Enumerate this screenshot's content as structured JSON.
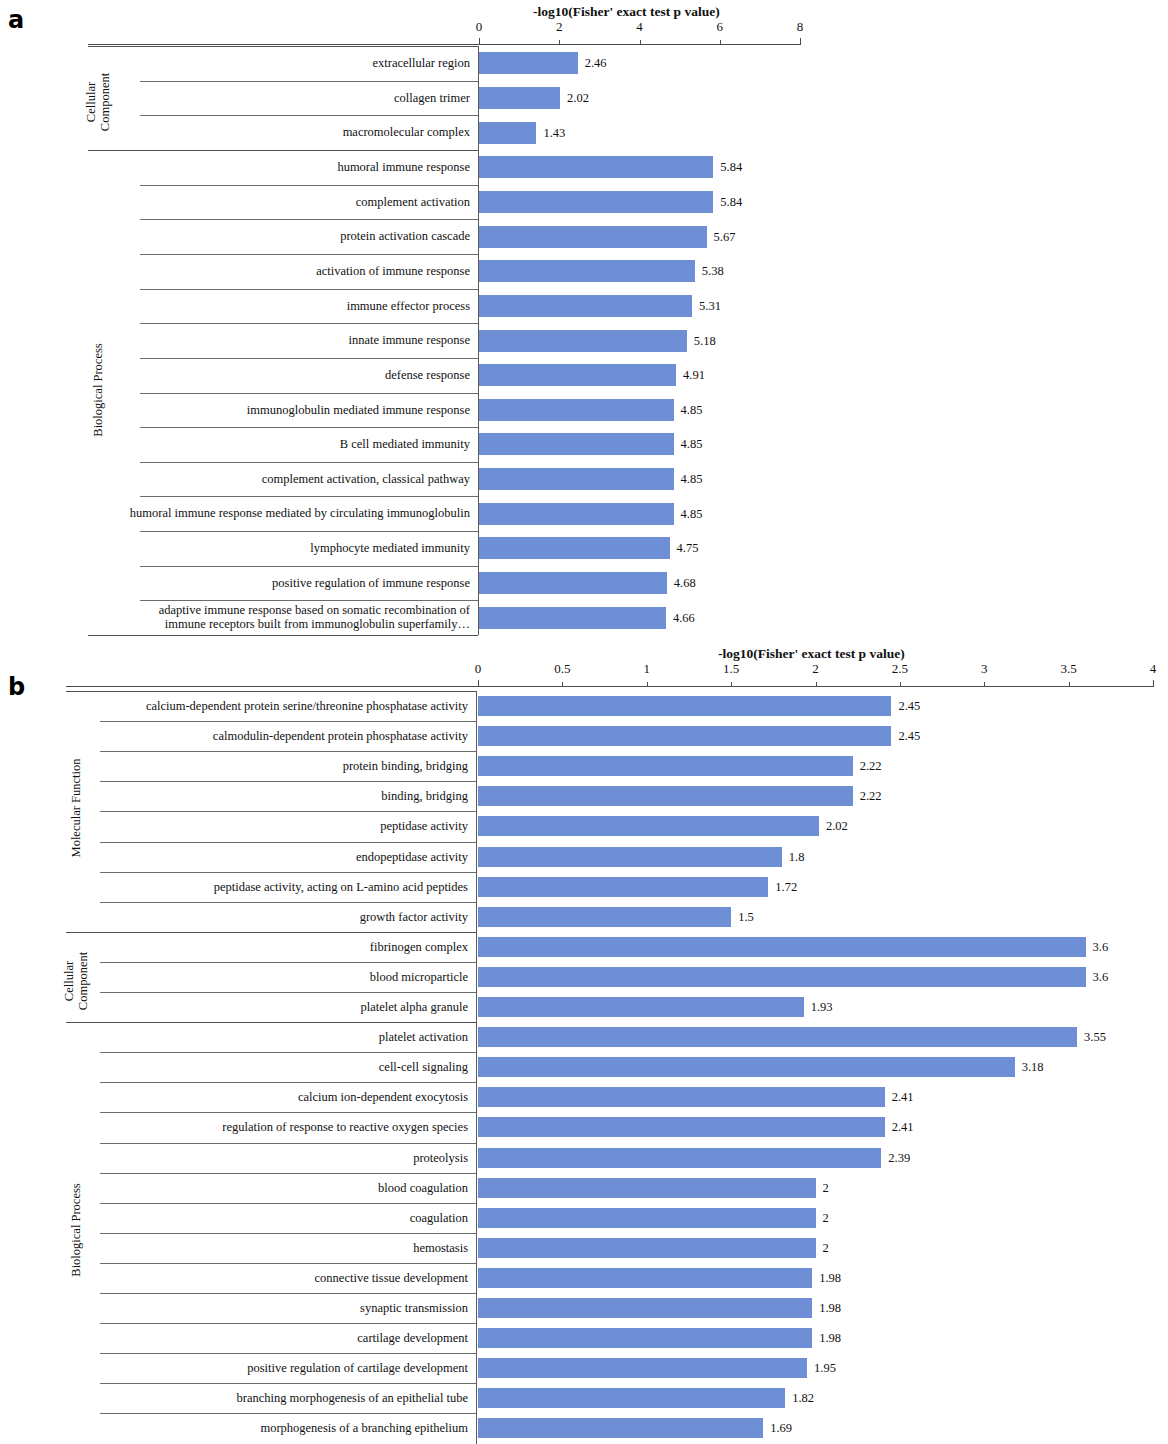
{
  "figure": {
    "panels": [
      {
        "letter": "a"
      },
      {
        "letter": "b"
      }
    ]
  },
  "chart_data": [
    {
      "panel": "a",
      "type": "bar",
      "orientation": "horizontal",
      "title": "-log10(Fisher' exact test p value)",
      "xlabel": "-log10(Fisher' exact test p value)",
      "ylabel": "",
      "xlim": [
        0,
        8
      ],
      "xticks": [
        0,
        2,
        4,
        6,
        8
      ],
      "xtick_labels": [
        "0",
        "2",
        "4",
        "6",
        "8"
      ],
      "grid": false,
      "legend": "none",
      "bar_color": "#6e8fd6",
      "groups": [
        {
          "name": "Cellular Component",
          "name_lines": [
            "Cellular",
            "Component"
          ],
          "categories": [
            "extracellular region",
            "collagen trimer",
            "macromolecular complex"
          ],
          "values": [
            2.46,
            2.02,
            1.43
          ],
          "value_labels": [
            "2.46",
            "2.02",
            "1.43"
          ]
        },
        {
          "name": "Biological Process",
          "name_lines": [
            "Biological Process"
          ],
          "categories": [
            "humoral immune response",
            "complement activation",
            "protein activation cascade",
            "activation of immune response",
            "immune effector process",
            "innate immune response",
            "defense response",
            "immunoglobulin mediated immune response",
            "B cell mediated immunity",
            "complement activation, classical pathway",
            "humoral immune response mediated by circulating immunoglobulin",
            "lymphocyte mediated immunity",
            "positive regulation of immune response",
            "adaptive immune response based on somatic recombination of immune receptors built from immunoglobulin superfamily…"
          ],
          "values": [
            5.84,
            5.84,
            5.67,
            5.38,
            5.31,
            5.18,
            4.91,
            4.85,
            4.85,
            4.85,
            4.85,
            4.75,
            4.68,
            4.66
          ],
          "value_labels": [
            "5.84",
            "5.84",
            "5.67",
            "5.38",
            "5.31",
            "5.18",
            "4.91",
            "4.85",
            "4.85",
            "4.85",
            "4.85",
            "4.75",
            "4.68",
            "4.66"
          ]
        }
      ]
    },
    {
      "panel": "b",
      "type": "bar",
      "orientation": "horizontal",
      "title": "-log10(Fisher' exact test p value)",
      "xlabel": "-log10(Fisher' exact test p value)",
      "ylabel": "",
      "xlim": [
        0,
        4
      ],
      "xticks": [
        0,
        0.5,
        1,
        1.5,
        2,
        2.5,
        3,
        3.5,
        4
      ],
      "xtick_labels": [
        "0",
        "0.5",
        "1",
        "1.5",
        "2",
        "2.5",
        "3",
        "3.5",
        "4"
      ],
      "grid": false,
      "legend": "none",
      "bar_color": "#6e8fd6",
      "groups": [
        {
          "name": "Molecular Function",
          "name_lines": [
            "Molecular Function"
          ],
          "categories": [
            "calcium-dependent protein serine/threonine phosphatase activity",
            "calmodulin-dependent protein phosphatase activity",
            "protein binding, bridging",
            "binding, bridging",
            "peptidase activity",
            "endopeptidase activity",
            "peptidase activity, acting on L-amino acid peptides",
            "growth factor activity"
          ],
          "values": [
            2.45,
            2.45,
            2.22,
            2.22,
            2.02,
            1.8,
            1.72,
            1.5
          ],
          "value_labels": [
            "2.45",
            "2.45",
            "2.22",
            "2.22",
            "2.02",
            "1.8",
            "1.72",
            "1.5"
          ]
        },
        {
          "name": "Cellular Component",
          "name_lines": [
            "Cellular",
            "Component"
          ],
          "categories": [
            "fibrinogen complex",
            "blood microparticle",
            "platelet alpha granule"
          ],
          "values": [
            3.6,
            3.6,
            1.93
          ],
          "value_labels": [
            "3.6",
            "3.6",
            "1.93"
          ]
        },
        {
          "name": "Biological Process",
          "name_lines": [
            "Biological Process"
          ],
          "categories": [
            "platelet activation",
            "cell-cell signaling",
            "calcium ion-dependent exocytosis",
            "regulation of response to reactive oxygen species",
            "proteolysis",
            "blood coagulation",
            "coagulation",
            "hemostasis",
            "connective tissue development",
            "synaptic transmission",
            "cartilage development",
            "positive regulation of cartilage development",
            "branching morphogenesis of an epithelial tube",
            "morphogenesis of a branching epithelium"
          ],
          "values": [
            3.55,
            3.18,
            2.41,
            2.41,
            2.39,
            2,
            2,
            2,
            1.98,
            1.98,
            1.98,
            1.95,
            1.82,
            1.69
          ],
          "value_labels": [
            "3.55",
            "3.18",
            "2.41",
            "2.41",
            "2.39",
            "2",
            "2",
            "2",
            "1.98",
            "1.98",
            "1.98",
            "1.95",
            "1.82",
            "1.69"
          ]
        }
      ]
    }
  ]
}
